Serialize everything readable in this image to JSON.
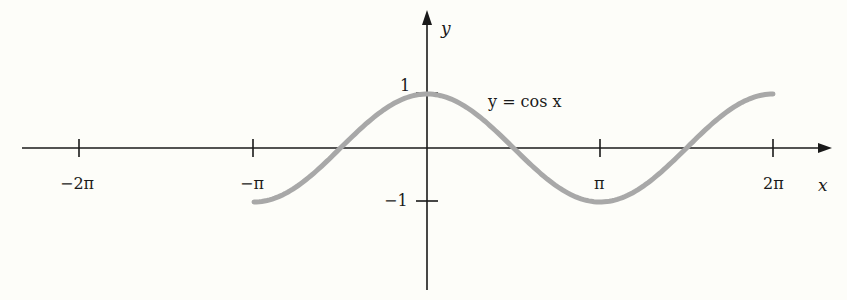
{
  "chart_data": {
    "type": "line",
    "title": "",
    "xlabel": "x",
    "ylabel": "y",
    "annotation": "y = cos x",
    "series": [
      {
        "name": "y = cos x",
        "color": "#a8a8a8",
        "x_range": [
          "-π",
          "2π"
        ],
        "x": [
          -3.1416,
          -2.3562,
          -1.5708,
          -0.7854,
          0,
          0.7854,
          1.5708,
          2.3562,
          3.1416,
          3.927,
          4.7124,
          5.4978,
          6.2832
        ],
        "values": [
          -1,
          -0.7071,
          0,
          0.7071,
          1,
          0.7071,
          0,
          -0.7071,
          -1,
          -0.7071,
          0,
          0.7071,
          1
        ]
      }
    ],
    "x_ticks": [
      {
        "value": -6.2832,
        "label": "−2π"
      },
      {
        "value": -3.1416,
        "label": "−π"
      },
      {
        "value": 3.1416,
        "label": "π"
      },
      {
        "value": 6.2832,
        "label": "2π"
      }
    ],
    "y_ticks": [
      {
        "value": 1,
        "label": "1"
      },
      {
        "value": -1,
        "label": "−1"
      }
    ],
    "xlim": [
      -7.7,
      7.4
    ],
    "ylim": [
      -2.6,
      2.55
    ],
    "grid": false,
    "legend": "none"
  },
  "labels": {
    "x_axis": "x",
    "y_axis": "y",
    "curve": "y = cos x",
    "tick_neg2pi": "−2π",
    "tick_negpi": "−π",
    "tick_pi": "π",
    "tick_2pi": "2π",
    "tick_y1": "1",
    "tick_yneg1": "−1"
  }
}
